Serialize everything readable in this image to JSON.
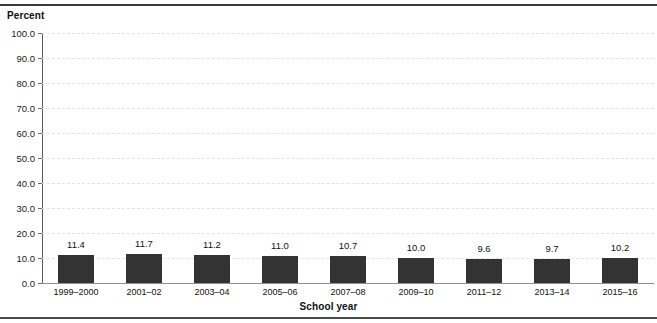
{
  "figure": {
    "y_axis_title": "Percent",
    "x_axis_title": "School year"
  },
  "chart_data": {
    "type": "bar",
    "title": "",
    "xlabel": "School year",
    "ylabel": "Percent",
    "categories": [
      "1999–2000",
      "2001–02",
      "2003–04",
      "2005–06",
      "2007–08",
      "2009–10",
      "2011–12",
      "2013–14",
      "2015–16"
    ],
    "values": [
      11.4,
      11.7,
      11.2,
      11.0,
      10.7,
      10.0,
      9.6,
      9.7,
      10.2
    ],
    "value_labels": [
      "11.4",
      "11.7",
      "11.2",
      "11.0",
      "10.7",
      "10.0",
      "9.6",
      "9.7",
      "10.2"
    ],
    "ylim": [
      0,
      100
    ],
    "ytick_values": [
      0.0,
      10.0,
      20.0,
      30.0,
      40.0,
      50.0,
      60.0,
      70.0,
      80.0,
      90.0,
      100.0
    ],
    "ytick_labels": [
      "0.0",
      "10.0",
      "20.0",
      "30.0",
      "40.0",
      "50.0",
      "60.0",
      "70.0",
      "80.0",
      "90.0",
      "100.0"
    ],
    "grid": true,
    "grid_axis": "y",
    "grid_style": "dashed",
    "legend": false,
    "bar_color": "#333333",
    "background_color": "#ffffff"
  }
}
